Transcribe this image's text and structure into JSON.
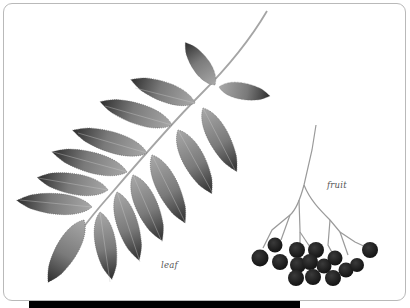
{
  "illustration": {
    "subject": "rowan (mountain ash) leaf and fruit",
    "labels": {
      "leaf": "leaf",
      "fruit": "fruit"
    },
    "colors": {
      "background": "#ffffff",
      "card_border": "#b9b9b9",
      "leaf_fill": "#8a8a8a",
      "leaf_dark": "#3a3a3a",
      "berry": "#1c1c1c",
      "stem": "#9a9a9a",
      "bottom_bar": "#000000"
    }
  }
}
